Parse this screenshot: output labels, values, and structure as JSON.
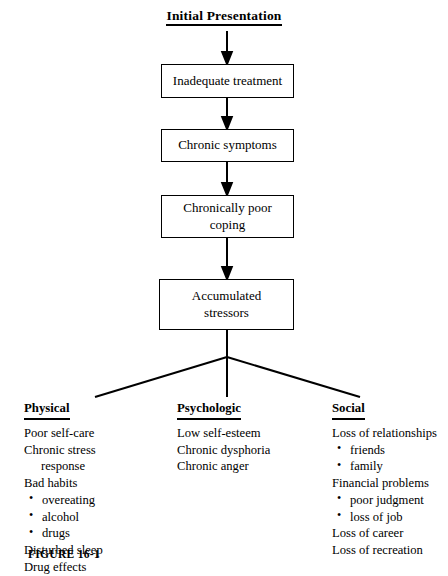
{
  "figure": {
    "title": "Initial Presentation",
    "caption": "FIGURE 16-1",
    "flow": [
      {
        "label": "Inadequate treatment"
      },
      {
        "label": "Chronic symptoms"
      },
      {
        "label": "Chronically poor\ncoping"
      },
      {
        "label": "Accumulated\nstressors"
      }
    ],
    "columns": [
      {
        "heading": "Physical",
        "items": [
          {
            "text": "Poor self-care",
            "style": "plain"
          },
          {
            "text": "Chronic stress",
            "style": "plain"
          },
          {
            "text": "response",
            "style": "continuation"
          },
          {
            "text": "Bad habits",
            "style": "plain"
          },
          {
            "text": "overeating",
            "style": "bullet"
          },
          {
            "text": "alcohol",
            "style": "bullet"
          },
          {
            "text": "drugs",
            "style": "bullet"
          },
          {
            "text": "Disturbed sleep",
            "style": "plain"
          },
          {
            "text": "Drug effects",
            "style": "plain"
          }
        ]
      },
      {
        "heading": "Psychologic",
        "items": [
          {
            "text": "Low self-esteem",
            "style": "plain"
          },
          {
            "text": "Chronic dysphoria",
            "style": "plain"
          },
          {
            "text": "Chronic anger",
            "style": "plain"
          }
        ]
      },
      {
        "heading": "Social",
        "items": [
          {
            "text": "Loss of relationships",
            "style": "plain"
          },
          {
            "text": "friends",
            "style": "bullet"
          },
          {
            "text": "family",
            "style": "bullet"
          },
          {
            "text": "Financial problems",
            "style": "plain"
          },
          {
            "text": "poor judgment",
            "style": "bullet"
          },
          {
            "text": "loss of job",
            "style": "bullet"
          },
          {
            "text": "Loss of career",
            "style": "plain"
          },
          {
            "text": "Loss of recreation",
            "style": "plain"
          }
        ]
      }
    ],
    "colors": {
      "stroke": "#000000",
      "background": "#ffffff"
    }
  }
}
